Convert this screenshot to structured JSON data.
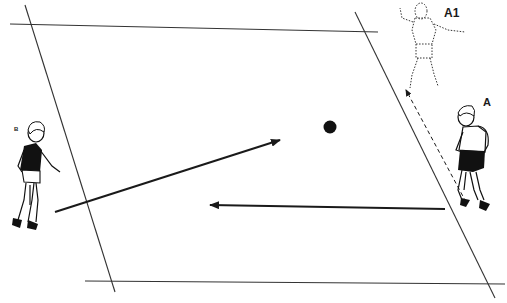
{
  "diagram": {
    "type": "sports drill illustration",
    "colors": {
      "ink": "#1a1a1a",
      "background": "#ffffff",
      "player_shirt": "#111111"
    },
    "players": [
      {
        "id": "A1",
        "label": "A1",
        "style": "dotted outline (future position)",
        "position": [
          432,
          50
        ]
      },
      {
        "id": "A",
        "label": "A",
        "style": "solid",
        "position": [
          475,
          160
        ]
      },
      {
        "id": "B",
        "label": "B",
        "style": "solid",
        "position": [
          35,
          170
        ]
      }
    ],
    "ball": {
      "position": [
        330,
        127
      ]
    },
    "arrows": [
      {
        "name": "pass-from-B",
        "from": [
          55,
          212
        ],
        "to": [
          280,
          140
        ],
        "style": "solid"
      },
      {
        "name": "pass-from-A",
        "from": [
          445,
          209
        ],
        "to": [
          210,
          205
        ],
        "style": "solid"
      },
      {
        "name": "run-A-to-A1",
        "from": [
          466,
          202
        ],
        "to": [
          405,
          88
        ],
        "style": "dashed"
      }
    ],
    "field_lines": [
      {
        "name": "top-line",
        "from": [
          10,
          24
        ],
        "to": [
          378,
          32
        ]
      },
      {
        "name": "bottom-line",
        "from": [
          85,
          281
        ],
        "to": [
          505,
          284
        ]
      },
      {
        "name": "left-line",
        "from": [
          25,
          5
        ],
        "to": [
          115,
          292
        ]
      },
      {
        "name": "right-line",
        "from": [
          355,
          12
        ],
        "to": [
          495,
          298
        ]
      }
    ]
  }
}
